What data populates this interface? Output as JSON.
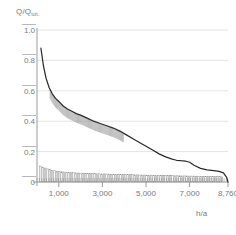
{
  "chart_data": {
    "type": "area",
    "title": "",
    "subtitle": "",
    "xlabel": "h/a",
    "ylabel": "Q/Q",
    "ylabel_sub": "tot.",
    "xlim": [
      0,
      8760
    ],
    "ylim": [
      0,
      1.0
    ],
    "grid": true,
    "legend": "none",
    "y_ticks": [
      "1.0",
      "0.8",
      "0.6",
      "0.4",
      "0.2",
      "0"
    ],
    "y_tick_values": [
      1.0,
      0.8,
      0.6,
      0.4,
      0.2,
      0
    ],
    "x_ticks": [
      "1,000",
      "3,000",
      "5,000",
      "7,000",
      "8,760"
    ],
    "x_tick_values": [
      1000,
      3000,
      5000,
      7000,
      8760
    ],
    "series": [
      {
        "name": "Load duration curve",
        "kind": "line",
        "x": [
          180,
          300,
          420,
          560,
          700,
          850,
          1000,
          1200,
          1400,
          1600,
          1800,
          2000,
          2300,
          2600,
          2900,
          3200,
          3500,
          3800,
          4100,
          4400,
          4700,
          5000,
          5300,
          5600,
          5900,
          6200,
          6400,
          6600,
          6800,
          7000,
          7200,
          7500,
          7800,
          8100,
          8350,
          8550,
          8700,
          8760
        ],
        "values": [
          0.88,
          0.76,
          0.68,
          0.62,
          0.58,
          0.55,
          0.53,
          0.5,
          0.48,
          0.465,
          0.45,
          0.44,
          0.42,
          0.4,
          0.385,
          0.37,
          0.355,
          0.335,
          0.31,
          0.285,
          0.26,
          0.235,
          0.21,
          0.185,
          0.165,
          0.15,
          0.143,
          0.14,
          0.138,
          0.13,
          0.11,
          0.09,
          0.08,
          0.075,
          0.07,
          0.06,
          0.03,
          0.0
        ]
      },
      {
        "name": "Hatching band under curve (600-4000 h)",
        "kind": "vertical-hatch",
        "x_start": 600,
        "x_end": 4000,
        "depth": 0.06
      },
      {
        "name": "Hourly bar histogram at baseline",
        "kind": "bar",
        "x_start": 120,
        "x_end": 8560,
        "bar_count": 78,
        "values": [
          0.105,
          0.098,
          0.092,
          0.086,
          0.081,
          0.077,
          0.074,
          0.071,
          0.069,
          0.067,
          0.066,
          0.064,
          0.063,
          0.062,
          0.061,
          0.06,
          0.059,
          0.058,
          0.058,
          0.057,
          0.056,
          0.056,
          0.055,
          0.055,
          0.054,
          0.054,
          0.053,
          0.053,
          0.052,
          0.052,
          0.051,
          0.051,
          0.05,
          0.05,
          0.05,
          0.049,
          0.049,
          0.048,
          0.048,
          0.048,
          0.047,
          0.047,
          0.046,
          0.046,
          0.046,
          0.045,
          0.045,
          0.045,
          0.044,
          0.044,
          0.044,
          0.043,
          0.043,
          0.043,
          0.042,
          0.042,
          0.042,
          0.041,
          0.041,
          0.041,
          0.04,
          0.04,
          0.04,
          0.039,
          0.039,
          0.039,
          0.038,
          0.038,
          0.038,
          0.037,
          0.037,
          0.037,
          0.036,
          0.036,
          0.036,
          0.035,
          0.035,
          0.034
        ]
      }
    ],
    "colors": {
      "curve": "#2b2b2b",
      "grid": "#e4e4e4",
      "axis": "#9a9a9a",
      "hatch": "#8e8e8e",
      "bars": "#8e8e8e",
      "text": "#7a7a7a",
      "background": "#ffffff"
    }
  }
}
